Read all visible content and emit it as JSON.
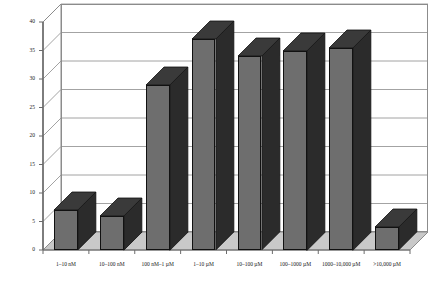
{
  "chart_data": {
    "type": "bar",
    "title": "",
    "subtitle": "",
    "xlabel": "",
    "ylabel": "",
    "ylim": [
      0,
      40
    ],
    "ytick_step": 5,
    "yticks": [
      "0",
      "5",
      "10",
      "15",
      "20",
      "25",
      "30",
      "35",
      "40"
    ],
    "grid": true,
    "legend": false,
    "three_d": true,
    "categories": [
      "1–10 nM",
      "10–100 nM",
      "100 nM–1 µM",
      "1–10 µM",
      "10–100 µM",
      "100–1000 µM",
      "1000–10,000 µM",
      ">10,000 µM"
    ],
    "values": [
      7,
      6,
      29,
      37,
      34,
      35,
      35.5,
      4
    ],
    "colors": {
      "bar_front": "#6e6e6e",
      "bar_side": "#2b2b2b",
      "bar_top": "#3a3a3a",
      "floor": "#c9c9c9",
      "plot_background": "#ffffff",
      "gridline": "#8c8c8c",
      "axis": "#6b6b6b",
      "text": "#1a1a1a"
    }
  },
  "axes": {
    "y_axis_name": "y-axis",
    "x_axis_name": "x-axis"
  }
}
